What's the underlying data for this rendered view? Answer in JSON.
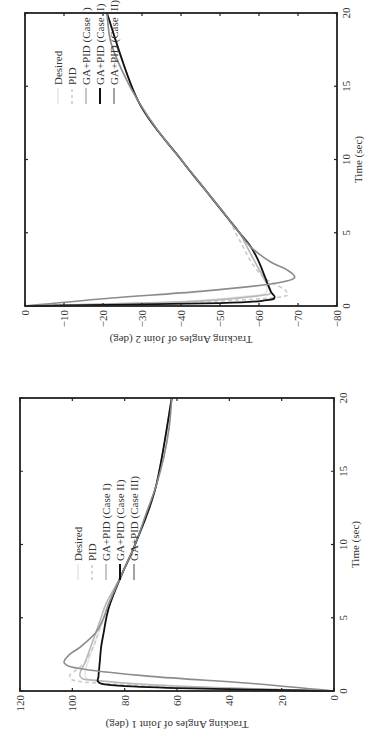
{
  "chart_data": [
    {
      "type": "line",
      "title": "",
      "xlabel": "Time (sec)",
      "ylabel": "Tracking Angles of Joint 2 (deg)",
      "xlim": [
        0,
        20
      ],
      "ylim": [
        -80,
        0
      ],
      "xticks": [
        "0",
        "5",
        "10",
        "15",
        "20"
      ],
      "yticks": [
        "0",
        "−10",
        "−20",
        "−30",
        "−40",
        "−50",
        "−60",
        "−70",
        "−80"
      ],
      "grid": false,
      "legend_position": "upper-middle",
      "legend": [
        "Desired",
        "PID",
        "GA+PID (Case I)",
        "GA+PID (Case II)",
        "GA+PID (Case III)"
      ],
      "series": [
        {
          "name": "Desired",
          "style": "solid",
          "color": "#e6e6e6",
          "x": [
            0,
            0.3,
            0.7,
            1,
            2,
            3,
            4,
            5,
            6,
            8,
            10,
            12,
            14,
            16,
            18,
            20
          ],
          "y": [
            0,
            -40,
            -58,
            -62,
            -61,
            -59,
            -57,
            -55,
            -52,
            -46,
            -40,
            -34,
            -29,
            -25,
            -22,
            -21
          ]
        },
        {
          "name": "PID",
          "style": "dashed",
          "color": "#cccccc",
          "x": [
            0,
            0.3,
            0.6,
            1,
            1.5,
            2,
            3,
            4,
            5,
            6,
            8,
            10,
            14,
            20
          ],
          "y": [
            0,
            -45,
            -65,
            -67,
            -64,
            -61,
            -58,
            -56,
            -54,
            -52,
            -46,
            -40,
            -29,
            -21
          ]
        },
        {
          "name": "GA+PID (Case I)",
          "style": "solid",
          "color": "#b8b8b8",
          "x": [
            0,
            0.3,
            0.7,
            1,
            2,
            3,
            4,
            5,
            6,
            8,
            10,
            14,
            20
          ],
          "y": [
            0,
            -42,
            -60,
            -63,
            -61,
            -59,
            -57,
            -55,
            -52,
            -46,
            -40,
            -29,
            -21
          ]
        },
        {
          "name": "GA+PID (Case II)",
          "style": "solid",
          "color": "#111111",
          "x": [
            0,
            0.2,
            0.4,
            0.6,
            1,
            2,
            3,
            4,
            5,
            6,
            8,
            10,
            14,
            20
          ],
          "y": [
            0,
            -50,
            -62,
            -64,
            -63,
            -61.5,
            -60,
            -58,
            -55,
            -52,
            -46,
            -40,
            -29,
            -21
          ]
        },
        {
          "name": "GA+PID (Case III)",
          "style": "solid",
          "color": "#8c8c8c",
          "x": [
            0,
            0.5,
            1,
            1.5,
            1.9,
            2.5,
            3,
            4,
            5,
            6,
            8,
            10,
            12,
            14,
            16,
            18,
            20
          ],
          "y": [
            0,
            -20,
            -45,
            -63,
            -69,
            -67,
            -63,
            -58,
            -55,
            -52,
            -46,
            -40,
            -34,
            -29,
            -25,
            -22,
            -21
          ]
        }
      ]
    },
    {
      "type": "line",
      "title": "",
      "xlabel": "Time (sec)",
      "ylabel": "Tracking Angles of Joint 1 (deg)",
      "xlim": [
        0,
        20
      ],
      "ylim": [
        0,
        120
      ],
      "xticks": [
        "0",
        "5",
        "10",
        "15",
        "20"
      ],
      "yticks": [
        "0",
        "20",
        "40",
        "60",
        "80",
        "100",
        "120"
      ],
      "grid": false,
      "legend_position": "middle-right",
      "legend": [
        "Desired",
        "PID",
        "GA+PID (Case I)",
        "GA+PID (Case II)",
        "GA+PID (Case III)"
      ],
      "series": [
        {
          "name": "Desired",
          "style": "solid",
          "color": "#e6e6e6",
          "x": [
            0,
            0.3,
            0.7,
            1,
            2,
            3,
            4,
            5,
            6,
            8,
            10,
            12,
            14,
            16,
            18,
            20
          ],
          "y": [
            0,
            60,
            90,
            95,
            94,
            92,
            90,
            88,
            86,
            81,
            76,
            72,
            68,
            65,
            63,
            62
          ]
        },
        {
          "name": "PID",
          "style": "dashed",
          "color": "#cccccc",
          "x": [
            0,
            0.3,
            0.6,
            1,
            1.5,
            2,
            3,
            4,
            5,
            6,
            8,
            10,
            14,
            20
          ],
          "y": [
            0,
            60,
            95,
            101,
            98,
            95,
            92,
            90,
            88,
            86,
            81,
            76,
            68,
            62
          ]
        },
        {
          "name": "GA+PID (Case I)",
          "style": "solid",
          "color": "#b8b8b8",
          "x": [
            0,
            0.3,
            0.7,
            1,
            2,
            3,
            4,
            5,
            6,
            8,
            10,
            14,
            20
          ],
          "y": [
            0,
            55,
            90,
            97,
            95,
            93,
            91,
            89,
            87,
            81,
            76,
            68,
            62
          ]
        },
        {
          "name": "GA+PID (Case II)",
          "style": "solid",
          "color": "#111111",
          "x": [
            0,
            0.2,
            0.4,
            0.6,
            1,
            2,
            3,
            4,
            5,
            6,
            8,
            10,
            14,
            20
          ],
          "y": [
            0,
            60,
            85,
            90,
            90,
            89.5,
            89,
            88,
            87,
            85.5,
            81,
            76,
            68,
            62
          ]
        },
        {
          "name": "GA+PID (Case III)",
          "style": "solid",
          "color": "#8c8c8c",
          "x": [
            0,
            0.5,
            1,
            1.5,
            1.9,
            2.5,
            3,
            4,
            5,
            6,
            8,
            10,
            12,
            14,
            16,
            18,
            20
          ],
          "y": [
            0,
            30,
            70,
            96,
            103,
            101,
            97,
            91,
            88,
            86,
            81,
            76,
            72,
            68,
            65,
            63,
            62
          ]
        }
      ]
    }
  ]
}
